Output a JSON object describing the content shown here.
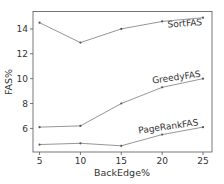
{
  "chart_data": {
    "type": "line",
    "title": "",
    "xlabel": "BackEdge%",
    "ylabel": "FAS%",
    "x": [
      5,
      10,
      15,
      20,
      25
    ],
    "xticks": [
      5,
      10,
      15,
      20,
      25
    ],
    "yticks": [
      6,
      8,
      10,
      12,
      14
    ],
    "xlim": [
      4.2,
      26.1
    ],
    "ylim": [
      4.1,
      15.4
    ],
    "grid": false,
    "legend": "inline labels near line ends",
    "series": [
      {
        "name": "SortFAS",
        "values": [
          14.5,
          12.9,
          14.0,
          14.6,
          14.9
        ],
        "label_at_x": 22.8,
        "label_offset_y": 7,
        "label_rotation": -4
      },
      {
        "name": "GreedyFAS",
        "values": [
          6.1,
          6.2,
          8.0,
          9.3,
          10.0
        ],
        "label_at_x": 21.8,
        "label_offset_y": -4,
        "label_rotation": -8
      },
      {
        "name": "PageRankFAS",
        "values": [
          4.7,
          4.8,
          4.6,
          5.5,
          6.1
        ],
        "label_at_x": 20.8,
        "label_offset_y": -4,
        "label_rotation": -8
      }
    ],
    "colors": {
      "line": "#8a8a8a",
      "marker": "#555555",
      "text": "#333333",
      "axis": "#555555",
      "tick_text": "#333333"
    }
  }
}
